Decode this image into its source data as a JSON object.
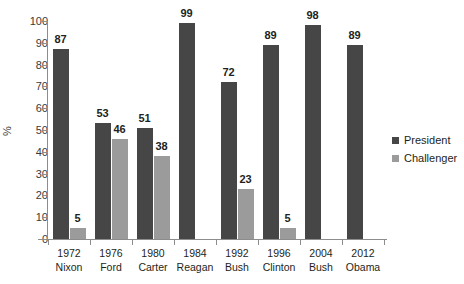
{
  "chart_data": {
    "type": "bar",
    "title": "",
    "subtitle": "",
    "xlabel": "",
    "ylabel": "%",
    "ylim": [
      0,
      100
    ],
    "ytick_step": 10,
    "yticks": [
      100,
      90,
      80,
      70,
      60,
      50,
      40,
      30,
      20,
      10,
      0
    ],
    "grid": false,
    "legend_position": "right",
    "categories": [
      "1972\nNixon",
      "1976\nFord",
      "1980\nCarter",
      "1984\nReagan",
      "1992\nBush",
      "1996\nClinton",
      "2004\nBush",
      "2012\nObama"
    ],
    "category_parts": [
      {
        "year": "1972",
        "name": "Nixon"
      },
      {
        "year": "1976",
        "name": "Ford"
      },
      {
        "year": "1980",
        "name": "Carter"
      },
      {
        "year": "1984",
        "name": "Reagan"
      },
      {
        "year": "1992",
        "name": "Bush"
      },
      {
        "year": "1996",
        "name": "Clinton"
      },
      {
        "year": "2004",
        "name": "Bush"
      },
      {
        "year": "2012",
        "name": "Obama"
      }
    ],
    "series": [
      {
        "name": "President",
        "color": "#464646",
        "values": [
          87,
          53,
          51,
          99,
          72,
          89,
          98,
          89
        ]
      },
      {
        "name": "Challenger",
        "color": "#9b9b9b",
        "values": [
          5,
          46,
          38,
          null,
          23,
          5,
          null,
          null
        ]
      }
    ]
  },
  "legend": {
    "items": [
      {
        "label": "President",
        "swatch": "president"
      },
      {
        "label": "Challenger",
        "swatch": "challenger"
      }
    ]
  },
  "colors": {
    "president": "#464646",
    "challenger": "#9b9b9b",
    "axis": "#8d8d8d",
    "text": "#231f20",
    "background": "#ffffff"
  }
}
